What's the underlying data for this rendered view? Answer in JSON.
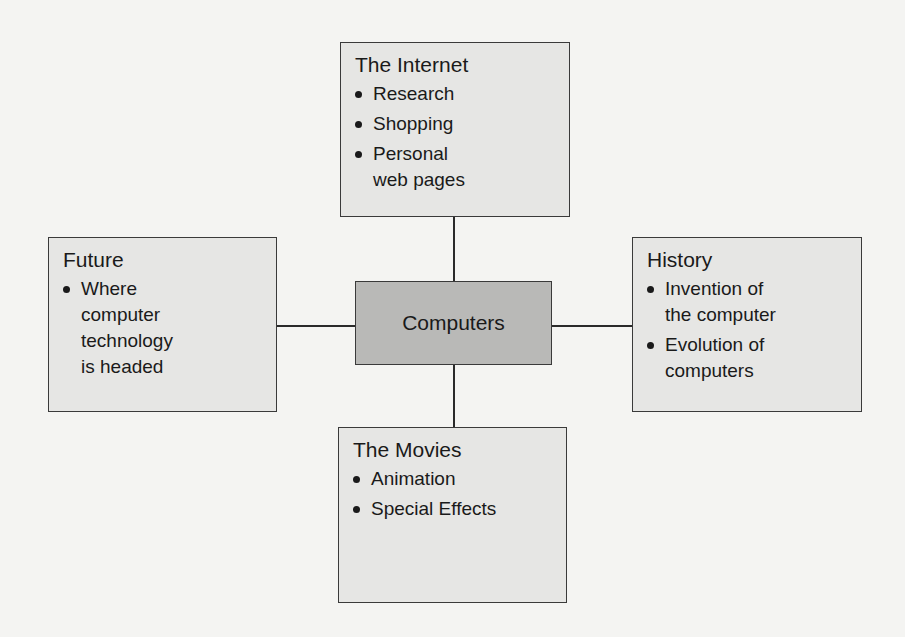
{
  "diagram": {
    "type": "concept-web",
    "center": {
      "label": "Computers"
    },
    "nodes": {
      "top": {
        "title": "The Internet",
        "items": [
          "Research",
          "Shopping",
          "Personal\nweb pages"
        ]
      },
      "left": {
        "title": "Future",
        "items": [
          "Where\ncomputer\ntechnology\nis headed"
        ]
      },
      "right": {
        "title": "History",
        "items": [
          "Invention of\nthe computer",
          "Evolution of\ncomputers"
        ]
      },
      "bottom": {
        "title": "The Movies",
        "items": [
          "Animation",
          "Special Effects"
        ]
      }
    },
    "colors": {
      "background": "#f4f4f2",
      "box_fill": "#e6e6e4",
      "center_fill": "#b9b9b7",
      "border": "#3a3a3a"
    }
  }
}
